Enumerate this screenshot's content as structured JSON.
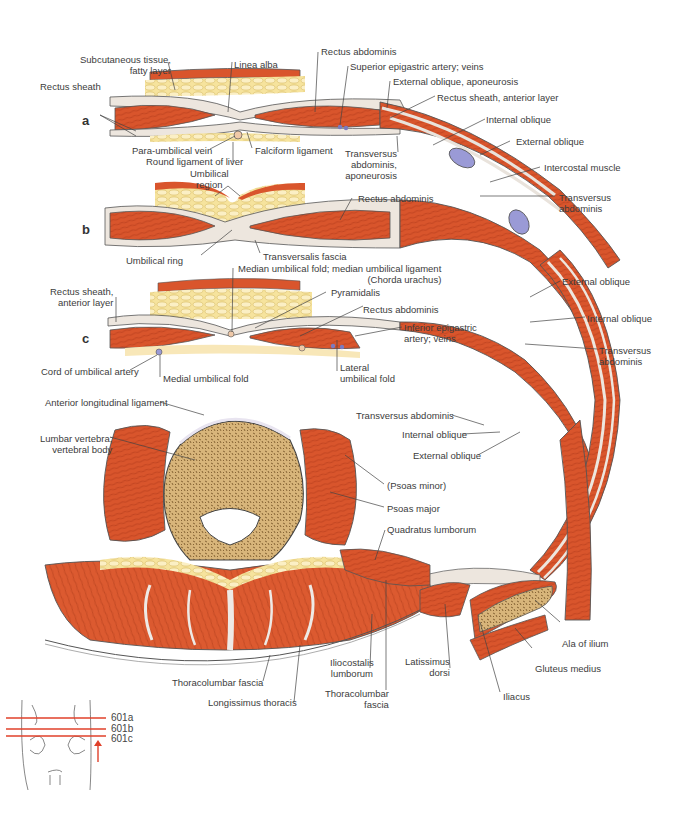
{
  "figure": {
    "sections": [
      "a",
      "b",
      "c"
    ],
    "colors": {
      "muscle": "#d9552c",
      "muscle_dark": "#b83e1d",
      "fat": "#f3dc8e",
      "fat_light": "#fbefc4",
      "bone": "#c9a466",
      "bone_dark": "#7d5a2c",
      "fascia": "#e9e3dc",
      "vessel": "#8f8fd0",
      "outline": "#4a4a4a",
      "level_line": "#e0402a"
    },
    "section_a": {
      "labels": {
        "subcutaneous": "Subcutaneous tissue,\nfatty layer",
        "linea_alba": "Linea alba",
        "rectus_abdominis": "Rectus abdominis",
        "superior_epigastric": "Superior epigastric artery; veins",
        "external_oblique_aponeurosis": "External oblique, aponeurosis",
        "rectus_sheath": "Rectus sheath",
        "rectus_sheath_anterior": "Rectus sheath, anterior layer",
        "internal_oblique": "Internal oblique",
        "external_oblique": "External oblique",
        "intercostal": "Intercostal muscle",
        "transversus": "Transversus\nabdominis",
        "para_umbilical_vein": "Para-umbilical vein",
        "round_ligament": "Round ligament of liver",
        "falciform": "Falciform ligament",
        "transversus_aponeurosis": "Transversus\nabdominis,\naponeurosis"
      }
    },
    "section_b": {
      "labels": {
        "umbilical_region": "Umbilical\nregion",
        "rectus_abdominis": "Rectus abdominis",
        "umbilical_ring": "Umbilical ring",
        "transversalis_fascia": "Transversalis fascia"
      }
    },
    "section_c": {
      "labels": {
        "median_umbilical": "Median umbilical fold; median umbilical ligament\n(Chorda urachus)",
        "rectus_sheath_anterior": "Rectus sheath,\nanterior layer",
        "pyramidalis": "Pyramidalis",
        "rectus_abdominis": "Rectus abdominis",
        "inferior_epigastric": "Inferior epigastric\nartery; veins",
        "cord_umbilical_artery": "Cord of umbilical artery",
        "medial_umbilical_fold": "Medial umbilical fold",
        "lateral_umbilical_fold": "Lateral\numbilical fold",
        "external_oblique": "External oblique",
        "internal_oblique": "Internal oblique",
        "transversus": "Transversus\nabdominis"
      }
    },
    "section_lumbar": {
      "labels": {
        "anterior_longitudinal": "Anterior longitudinal ligament",
        "lumbar_vertebra": "Lumbar vertebra;\nvertebral body",
        "transversus": "Transversus abdominis",
        "internal_oblique": "Internal oblique",
        "external_oblique": "External oblique",
        "psoas_minor": "(Psoas minor)",
        "psoas_major": "Psoas major",
        "quadratus_lumborum": "Quadratus lumborum",
        "ala_of_ilium": "Ala of ilium",
        "gluteus_medius": "Gluteus medius",
        "iliacus": "Iliacus",
        "thoracolumbar_fascia_left": "Thoracolumbar fascia",
        "longissimus": "Longissimus thoracis",
        "iliocostalis": "Iliocostalis\nlumborum",
        "thoracolumbar_fascia_right": "Thoracolumbar\nfascia",
        "latissimus": "Latissimus\ndorsi"
      }
    },
    "orientation_inset": {
      "levels": [
        "601a",
        "601b",
        "601c"
      ]
    }
  }
}
